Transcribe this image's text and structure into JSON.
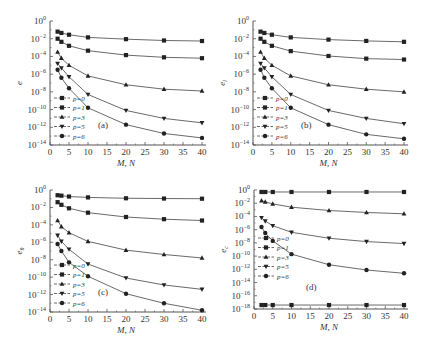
{
  "chart_data": [
    {
      "type": "line",
      "panel_label": "(a)",
      "xlabel": "M, N",
      "ylabel": "e",
      "ylabel_sub": "",
      "yscale": "log",
      "xlim": [
        0,
        40
      ],
      "ylim_exp": [
        -14,
        0
      ],
      "xticks": [
        0,
        5,
        10,
        15,
        20,
        25,
        30,
        35,
        40
      ],
      "yticks_exp": [
        0,
        -2,
        -4,
        -6,
        -8,
        -10,
        -12,
        -14
      ],
      "legend_position": "bottom-left",
      "x": [
        2,
        3,
        5,
        10,
        20,
        30,
        40
      ],
      "series": [
        {
          "name": "p=0",
          "marker": "square",
          "log10_values": [
            -1.2,
            -1.35,
            -1.55,
            -1.85,
            -2.05,
            -2.2,
            -2.26
          ]
        },
        {
          "name": "p=1",
          "marker": "square",
          "log10_values": [
            -2.0,
            -2.35,
            -2.8,
            -3.35,
            -3.85,
            -4.1,
            -4.2
          ]
        },
        {
          "name": "p=3",
          "marker": "triangle-up",
          "log10_values": [
            -3.5,
            -4.2,
            -5.0,
            -6.2,
            -7.2,
            -7.7,
            -7.9
          ]
        },
        {
          "name": "p=5",
          "marker": "triangle-down",
          "log10_values": [
            -4.8,
            -5.3,
            -6.3,
            -8.3,
            -10.1,
            -11.0,
            -11.5
          ]
        },
        {
          "name": "p=6",
          "marker": "circle",
          "log10_values": [
            -5.5,
            -6.4,
            -7.6,
            -9.8,
            -11.7,
            -12.7,
            -13.2
          ]
        }
      ]
    },
    {
      "type": "line",
      "panel_label": "(b)",
      "xlabel": "M, N",
      "ylabel": "e",
      "ylabel_sub": "l",
      "yscale": "log",
      "xlim": [
        0,
        40
      ],
      "ylim_exp": [
        -14,
        0
      ],
      "xticks": [
        0,
        5,
        10,
        15,
        20,
        25,
        30,
        35,
        40
      ],
      "yticks_exp": [
        0,
        -2,
        -4,
        -6,
        -8,
        -10,
        -12,
        -14
      ],
      "legend_position": "bottom-left",
      "x": [
        2,
        3,
        5,
        10,
        20,
        30,
        40
      ],
      "series": [
        {
          "name": "p=0",
          "marker": "square",
          "log10_values": [
            -1.2,
            -1.35,
            -1.55,
            -1.85,
            -2.1,
            -2.25,
            -2.35
          ]
        },
        {
          "name": "p=1",
          "marker": "square",
          "log10_values": [
            -2.0,
            -2.35,
            -2.8,
            -3.4,
            -3.95,
            -4.25,
            -4.35
          ]
        },
        {
          "name": "p=3",
          "marker": "triangle-up",
          "log10_values": [
            -3.5,
            -4.2,
            -5.0,
            -6.2,
            -7.2,
            -7.7,
            -8.0
          ]
        },
        {
          "name": "p=5",
          "marker": "triangle-down",
          "log10_values": [
            -4.8,
            -5.3,
            -6.3,
            -8.3,
            -10.1,
            -11.0,
            -11.6
          ]
        },
        {
          "name": "p=6",
          "marker": "circle",
          "log10_values": [
            -5.5,
            -6.4,
            -7.6,
            -9.8,
            -11.7,
            -12.8,
            -13.3
          ]
        }
      ]
    },
    {
      "type": "line",
      "panel_label": "(c)",
      "xlabel": "M, N",
      "ylabel": "e",
      "ylabel_sub": "θ",
      "yscale": "log",
      "xlim": [
        0,
        40
      ],
      "ylim_exp": [
        -14,
        0
      ],
      "xticks": [
        0,
        5,
        10,
        15,
        20,
        25,
        30,
        35,
        40
      ],
      "yticks_exp": [
        0,
        -2,
        -4,
        -6,
        -8,
        -10,
        -12,
        -14
      ],
      "legend_position": "bottom-left",
      "x": [
        2,
        3,
        5,
        10,
        20,
        30,
        40
      ],
      "series": [
        {
          "name": "p=0",
          "marker": "square",
          "log10_values": [
            -0.6,
            -0.65,
            -0.75,
            -0.85,
            -0.95,
            -0.98,
            -1.0
          ]
        },
        {
          "name": "p=1",
          "marker": "square",
          "log10_values": [
            -1.4,
            -1.7,
            -2.1,
            -2.6,
            -3.1,
            -3.35,
            -3.5
          ]
        },
        {
          "name": "p=3",
          "marker": "triangle-up",
          "log10_values": [
            -3.5,
            -4.2,
            -4.9,
            -5.9,
            -6.9,
            -7.4,
            -7.8
          ]
        },
        {
          "name": "p=5",
          "marker": "triangle-down",
          "log10_values": [
            -5.2,
            -5.9,
            -6.8,
            -8.5,
            -10.1,
            -10.9,
            -11.4
          ]
        },
        {
          "name": "p=6",
          "marker": "circle",
          "log10_values": [
            -6.2,
            -7.0,
            -8.3,
            -9.9,
            -11.9,
            -13.0,
            -13.8
          ]
        }
      ]
    },
    {
      "type": "line",
      "panel_label": "(d)",
      "xlabel": "M, N",
      "ylabel": "e",
      "ylabel_sub": "c",
      "yscale": "log",
      "xlim": [
        0,
        40
      ],
      "ylim_exp": [
        -18,
        0
      ],
      "xticks": [
        0,
        5,
        10,
        15,
        20,
        25,
        30,
        35,
        40
      ],
      "yticks_exp": [
        0,
        -2,
        -4,
        -6,
        -8,
        -10,
        -12,
        -14,
        -16,
        -18
      ],
      "legend_position": "bottom-left",
      "x": [
        2,
        3,
        5,
        10,
        20,
        30,
        40
      ],
      "series": [
        {
          "name": "p=0",
          "marker": "square",
          "log10_values": [
            -0.3,
            -0.3,
            -0.3,
            -0.3,
            -0.3,
            -0.3,
            -0.3
          ]
        },
        {
          "name": "p=1",
          "marker": "square",
          "log10_values": [
            -17.4,
            -17.4,
            -17.4,
            -17.4,
            -17.4,
            -17.4,
            -17.4
          ]
        },
        {
          "name": "p=3",
          "marker": "triangle-up",
          "log10_values": [
            -1.6,
            -1.8,
            -2.1,
            -2.6,
            -3.1,
            -3.4,
            -3.6
          ]
        },
        {
          "name": "p=5",
          "marker": "triangle-down",
          "log10_values": [
            -4.2,
            -4.7,
            -5.4,
            -6.4,
            -7.3,
            -7.8,
            -8.1
          ]
        },
        {
          "name": "p=6",
          "marker": "circle",
          "log10_values": [
            -5.6,
            -6.5,
            -7.7,
            -9.7,
            -11.3,
            -12.1,
            -12.6
          ]
        }
      ]
    }
  ]
}
